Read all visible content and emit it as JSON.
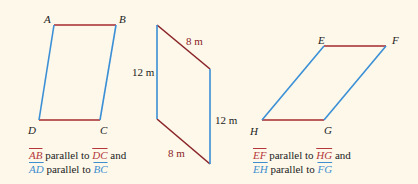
{
  "colors": {
    "red": "#a52a2e",
    "blue": "#3a8fd6",
    "background": "#fdf8ea"
  },
  "figure1": {
    "vertices": {
      "A": "A",
      "B": "B",
      "C": "C",
      "D": "D"
    },
    "caption": {
      "line1": {
        "seg1": "AB",
        "text1": " parallel to ",
        "seg2": "DC",
        "text2": " and"
      },
      "line2": {
        "seg1": "AD",
        "text1": " parallel to ",
        "seg2": "BC"
      }
    }
  },
  "figure2": {
    "labels": {
      "top": "8 m",
      "left": "12 m",
      "right": "12 m",
      "bottom": "8 m"
    }
  },
  "figure3": {
    "vertices": {
      "E": "E",
      "F": "F",
      "G": "G",
      "H": "H"
    },
    "caption": {
      "line1": {
        "seg1": "EF",
        "text1": " parallel to ",
        "seg2": "HG",
        "text2": " and"
      },
      "line2": {
        "seg1": "EH",
        "text1": " parallel to ",
        "seg2": "FG"
      }
    }
  }
}
